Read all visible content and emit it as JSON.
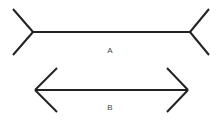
{
  "canvas": {
    "width": 219,
    "height": 127,
    "background_color": "#ffffff",
    "line_color": "#222222",
    "line_width": 2,
    "label_color": "#4a4a4a",
    "label_font_size": 8
  },
  "illusion": {
    "name": "Muller-Lyer illusion",
    "figure_count": 2
  },
  "figures": [
    {
      "id": "figure-a",
      "label": "A",
      "fin_direction": "outward",
      "fin_type": "arrowtail",
      "shaft": {
        "x1": 33,
        "y1": 32,
        "x2": 190,
        "y2": 32
      },
      "shaft_length": 157,
      "fins": [
        {
          "name": "top-left-fin",
          "x1": 33,
          "y1": 32,
          "x2": 13,
          "y2": 9
        },
        {
          "name": "bottom-left-fin",
          "x1": 33,
          "y1": 32,
          "x2": 13,
          "y2": 55
        },
        {
          "name": "top-right-fin",
          "x1": 190,
          "y1": 32,
          "x2": 209,
          "y2": 9
        },
        {
          "name": "bottom-right-fin",
          "x1": 190,
          "y1": 32,
          "x2": 209,
          "y2": 55
        }
      ],
      "label_position": {
        "x": 110,
        "y": 51
      }
    },
    {
      "id": "figure-b",
      "label": "B",
      "fin_direction": "inward",
      "fin_type": "arrowhead",
      "shaft": {
        "x1": 35,
        "y1": 90,
        "x2": 188,
        "y2": 90
      },
      "shaft_length": 153,
      "fins": [
        {
          "name": "top-left-fin",
          "x1": 35,
          "y1": 90,
          "x2": 57,
          "y2": 68
        },
        {
          "name": "bottom-left-fin",
          "x1": 35,
          "y1": 90,
          "x2": 57,
          "y2": 112
        },
        {
          "name": "top-right-fin",
          "x1": 188,
          "y1": 90,
          "x2": 167,
          "y2": 68
        },
        {
          "name": "bottom-right-fin",
          "x1": 188,
          "y1": 90,
          "x2": 167,
          "y2": 112
        }
      ],
      "label_position": {
        "x": 110,
        "y": 108
      }
    }
  ]
}
